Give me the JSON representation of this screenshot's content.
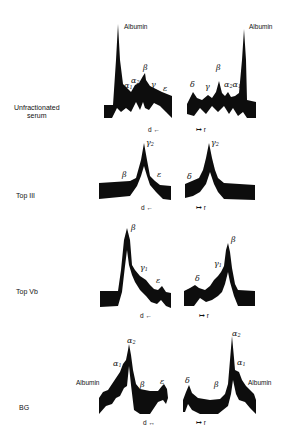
{
  "figure": {
    "rows": [
      {
        "label_line1": "Unfractionated",
        "label_line2": "serum",
        "left_peaks": [
          "Albumin",
          "α1",
          "α2",
          "β",
          "γ",
          "ε"
        ],
        "right_peaks": [
          "δ",
          "γ",
          "β",
          "α2α1",
          "Albumin"
        ],
        "left_axis": "d ←",
        "right_axis": "↦ r"
      },
      {
        "label_line1": "Top  III",
        "left_peaks": [
          "β",
          "γ2",
          "ε"
        ],
        "right_peaks": [
          "δ",
          "γ2"
        ],
        "left_axis": "d ←",
        "right_axis": "↦ r"
      },
      {
        "label_line1": "Top  Vb",
        "left_peaks": [
          "β",
          "γ1",
          "ε"
        ],
        "right_peaks": [
          "δ",
          "γ1",
          "β"
        ],
        "left_axis": "d ←",
        "right_axis": "↦ r"
      },
      {
        "label_line1": "BG",
        "left_peaks": [
          "Albumin",
          "α1",
          "α2",
          "β",
          "ε"
        ],
        "right_peaks": [
          "δ",
          "β",
          "α2",
          "α1",
          "Albumin"
        ],
        "left_axis": "d ↔",
        "right_axis": "↦ r"
      }
    ],
    "text": {
      "albumin": "Albumin",
      "alpha": "α",
      "beta": "β",
      "gamma": "γ",
      "delta": "δ",
      "epsilon": "ε",
      "sub1": "1",
      "sub2": "2",
      "d_left": "d ←",
      "d_both": "d ↔",
      "r_right": "↦ r",
      "row1_l1": "Unfractionated",
      "row1_l2": "serum",
      "row2": "Top  III",
      "row3": "Top  Vb",
      "row4": "BG"
    }
  }
}
